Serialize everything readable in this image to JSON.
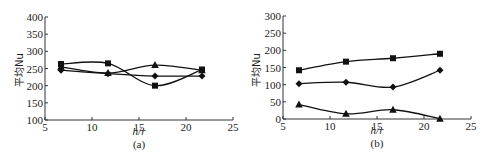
{
  "chart_data": [
    {
      "type": "line",
      "title": "",
      "caption": "(a)",
      "xlabel": "h/r",
      "ylabel": "平均Nu",
      "xlim": [
        5,
        25
      ],
      "ylim": [
        100,
        400
      ],
      "xticks": [
        5,
        10,
        15,
        20,
        25
      ],
      "yticks": [
        100,
        150,
        200,
        250,
        300,
        350,
        400
      ],
      "grid": false,
      "legend": "none",
      "x": [
        6.7,
        11.7,
        16.7,
        21.7
      ],
      "series": [
        {
          "name": "square",
          "marker": "square",
          "values": [
            263,
            265,
            200,
            247
          ]
        },
        {
          "name": "diamond",
          "marker": "diamond",
          "values": [
            245,
            235,
            228,
            228
          ]
        },
        {
          "name": "triangle",
          "marker": "triangle",
          "values": [
            255,
            237,
            260,
            245
          ]
        }
      ]
    },
    {
      "type": "line",
      "title": "",
      "caption": "(b)",
      "xlabel": "h/r",
      "ylabel": "平均Nu",
      "xlim": [
        5,
        25
      ],
      "ylim": [
        0,
        300
      ],
      "xticks": [
        5,
        10,
        15,
        20,
        25
      ],
      "yticks": [
        0,
        50,
        100,
        150,
        200,
        250,
        300
      ],
      "grid": false,
      "legend": "none",
      "x": [
        6.7,
        11.7,
        16.7,
        21.7
      ],
      "series": [
        {
          "name": "square",
          "marker": "square",
          "values": [
            142,
            167,
            177,
            190
          ]
        },
        {
          "name": "diamond",
          "marker": "diamond",
          "values": [
            103,
            107,
            93,
            142
          ]
        },
        {
          "name": "triangle",
          "marker": "triangle",
          "values": [
            42,
            15,
            27,
            1
          ]
        }
      ]
    }
  ],
  "charts": {
    "a": {
      "caption": "(a)",
      "xlabel": "h/r",
      "ylabel": "平均Nu",
      "yticks": [
        "100",
        "150",
        "200",
        "250",
        "300",
        "350",
        "400"
      ],
      "xticks": [
        "5",
        "10",
        "15",
        "20",
        "25"
      ]
    },
    "b": {
      "caption": "(b)",
      "xlabel": "h/r",
      "ylabel": "平均Nu",
      "yticks": [
        "0",
        "50",
        "100",
        "150",
        "200",
        "250",
        "300"
      ],
      "xticks": [
        "5",
        "10",
        "15",
        "20",
        "25"
      ]
    }
  }
}
